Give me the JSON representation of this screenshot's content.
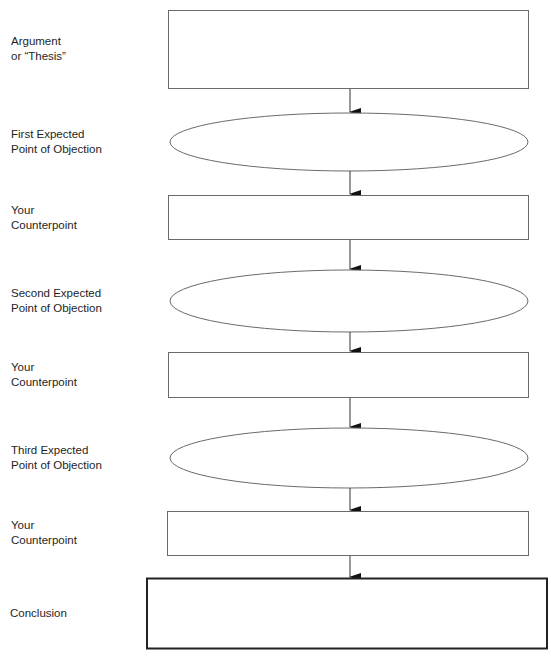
{
  "diagram": {
    "title": "",
    "type": "flowchart",
    "steps": [
      {
        "id": "thesis",
        "shape": "rectangle",
        "label": "Argument\nor “Thesis”",
        "content": ""
      },
      {
        "id": "objection-1",
        "shape": "ellipse",
        "label": "First Expected\nPoint of Objection",
        "content": ""
      },
      {
        "id": "counterpoint-1",
        "shape": "rectangle",
        "label": "Your\nCounterpoint",
        "content": ""
      },
      {
        "id": "objection-2",
        "shape": "ellipse",
        "label": "Second Expected\nPoint of Objection",
        "content": ""
      },
      {
        "id": "counterpoint-2",
        "shape": "rectangle",
        "label": "Your\nCounterpoint",
        "content": ""
      },
      {
        "id": "objection-3",
        "shape": "ellipse",
        "label": "Third Expected\nPoint of Objection",
        "content": ""
      },
      {
        "id": "counterpoint-3",
        "shape": "rectangle",
        "label": "Your\nCounterpoint",
        "content": ""
      },
      {
        "id": "conclusion",
        "shape": "rectangle-bold",
        "label": "Conclusion",
        "content": ""
      }
    ],
    "connectors": [
      {
        "from": "thesis",
        "to": "objection-1"
      },
      {
        "from": "objection-1",
        "to": "counterpoint-1"
      },
      {
        "from": "counterpoint-1",
        "to": "objection-2"
      },
      {
        "from": "objection-2",
        "to": "counterpoint-2"
      },
      {
        "from": "counterpoint-2",
        "to": "objection-3"
      },
      {
        "from": "objection-3",
        "to": "counterpoint-3"
      },
      {
        "from": "counterpoint-3",
        "to": "conclusion"
      }
    ],
    "colors": {
      "stroke": "#666666",
      "bold_stroke": "#222222",
      "arrow": "#111111",
      "text": "#1e1e1e"
    }
  }
}
